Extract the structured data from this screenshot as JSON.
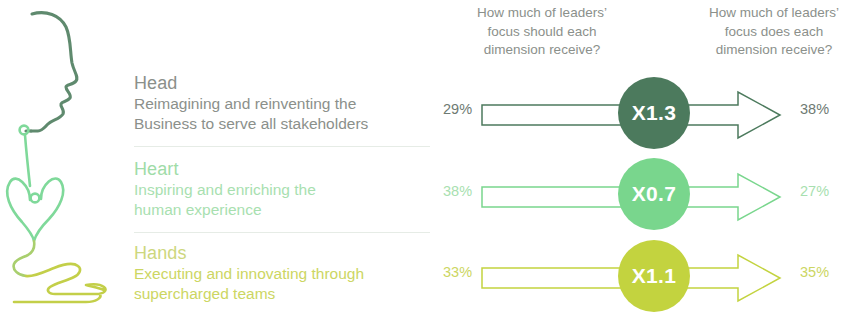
{
  "headers": {
    "should": "How much of leaders’ focus should each dimension receive?",
    "should_lines": [
      "How much of leaders’",
      "focus should each",
      "dimension receive?"
    ],
    "does": "How much of leaders’ focus does each dimension receive?",
    "does_lines": [
      "How much of leaders’",
      "focus does each",
      "dimension receive?"
    ]
  },
  "illustration": {
    "name": "head-heart-hands-line-drawing",
    "head_color": "#5f8a6e",
    "heart_color": "#7fd99a",
    "hands_color": "#c3cf49"
  },
  "colors": {
    "head": "#4c7a5d",
    "heart": "#79d68d",
    "hands": "#c3d33f",
    "text_gray": "#8b908b",
    "heart_text": "#a5dcae",
    "hands_text": "#cdd77e",
    "divider": "#e6ece6"
  },
  "rows": [
    {
      "key": "head",
      "title": "Head",
      "desc_lines": [
        "Reimagining and reinventing the",
        "Business to serve all stakeholders"
      ],
      "should_pct": "29%",
      "does_pct": "38%",
      "multiplier": "X1.3",
      "color": "#4c7a5d",
      "title_color": "#8b908b",
      "desc_color": "#8b908b",
      "pct_color": "#6e7a72"
    },
    {
      "key": "heart",
      "title": "Heart",
      "desc_lines": [
        "Inspiring and enriching the",
        "human experience"
      ],
      "should_pct": "38%",
      "does_pct": "27%",
      "multiplier": "X0.7",
      "color": "#79d68d",
      "title_color": "#9fdca8",
      "desc_color": "#a8dfb0",
      "pct_color": "#a8dfb0"
    },
    {
      "key": "hands",
      "title": "Hands",
      "desc_lines": [
        "Executing and innovating through",
        "supercharged teams"
      ],
      "should_pct": "33%",
      "does_pct": "35%",
      "multiplier": "X1.1",
      "color": "#c3d33f",
      "title_color": "#cdd77e",
      "desc_color": "#ccd662",
      "pct_color": "#ccd662"
    }
  ]
}
